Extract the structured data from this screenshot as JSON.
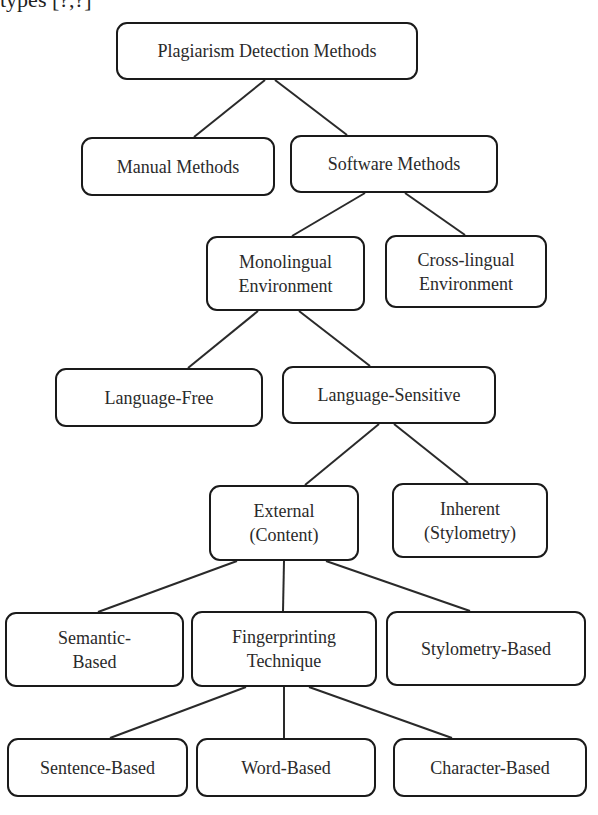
{
  "caption_fragment": "types [?,?]",
  "diagram": {
    "title": "Plagiarism Detection Methods",
    "line_color": "#2a2a2a",
    "node_border_color": "#1a1a1a",
    "nodes": {
      "root": {
        "lines": [
          "Plagiarism Detection Methods"
        ],
        "box": [
          116,
          22,
          302,
          58
        ]
      },
      "manual": {
        "lines": [
          "Manual Methods"
        ],
        "box": [
          81,
          137,
          194,
          59
        ]
      },
      "software": {
        "lines": [
          "Software Methods"
        ],
        "box": [
          290,
          135,
          208,
          58
        ]
      },
      "monolingual": {
        "lines": [
          "Monolingual",
          "Environment"
        ],
        "box": [
          206,
          236,
          159,
          75
        ]
      },
      "crosslingual": {
        "lines": [
          "Cross-lingual",
          "Environment"
        ],
        "box": [
          385,
          235,
          162,
          73
        ]
      },
      "language_free": {
        "lines": [
          "Language-Free"
        ],
        "box": [
          55,
          368,
          208,
          59
        ]
      },
      "language_sensitive": {
        "lines": [
          "Language-Sensitive"
        ],
        "box": [
          282,
          366,
          214,
          58
        ]
      },
      "external": {
        "lines": [
          "External",
          "(Content)"
        ],
        "box": [
          209,
          485,
          150,
          76
        ]
      },
      "inherent": {
        "lines": [
          "Inherent",
          "(Stylometry)"
        ],
        "box": [
          392,
          483,
          156,
          75
        ]
      },
      "semantic": {
        "lines": [
          "Semantic-",
          "Based"
        ],
        "box": [
          5,
          612,
          179,
          75
        ]
      },
      "fingerprinting": {
        "lines": [
          "Fingerprinting",
          "Technique"
        ],
        "box": [
          191,
          611,
          186,
          76
        ]
      },
      "stylometry_based": {
        "lines": [
          "Stylometry-Based"
        ],
        "box": [
          386,
          611,
          200,
          75
        ]
      },
      "sentence": {
        "lines": [
          "Sentence-Based"
        ],
        "box": [
          7,
          738,
          181,
          59
        ]
      },
      "word": {
        "lines": [
          "Word-Based"
        ],
        "box": [
          196,
          738,
          180,
          59
        ]
      },
      "character": {
        "lines": [
          "Character-Based"
        ],
        "box": [
          393,
          738,
          194,
          59
        ]
      }
    },
    "edges": [
      {
        "from": "root",
        "to": "manual",
        "pts": [
          265,
          80,
          194,
          137
        ]
      },
      {
        "from": "root",
        "to": "software",
        "pts": [
          275,
          80,
          347,
          135
        ]
      },
      {
        "from": "software",
        "to": "monolingual",
        "pts": [
          365,
          193,
          292,
          236
        ]
      },
      {
        "from": "software",
        "to": "crosslingual",
        "pts": [
          405,
          193,
          465,
          235
        ]
      },
      {
        "from": "monolingual",
        "to": "language_free",
        "pts": [
          258,
          311,
          188,
          368
        ]
      },
      {
        "from": "monolingual",
        "to": "language_sensitive",
        "pts": [
          299,
          311,
          370,
          366
        ]
      },
      {
        "from": "language_sensitive",
        "to": "external",
        "pts": [
          379,
          424,
          305,
          485
        ]
      },
      {
        "from": "language_sensitive",
        "to": "inherent",
        "pts": [
          394,
          424,
          468,
          483
        ]
      },
      {
        "from": "external",
        "to": "semantic",
        "pts": [
          237,
          561,
          98,
          612
        ]
      },
      {
        "from": "external",
        "to": "fingerprinting",
        "pts": [
          284,
          561,
          283,
          611
        ]
      },
      {
        "from": "external",
        "to": "stylometry_based",
        "pts": [
          326,
          561,
          470,
          611
        ]
      },
      {
        "from": "fingerprinting",
        "to": "sentence",
        "pts": [
          246,
          687,
          110,
          738
        ]
      },
      {
        "from": "fingerprinting",
        "to": "word",
        "pts": [
          284,
          687,
          284,
          738
        ]
      },
      {
        "from": "fingerprinting",
        "to": "character",
        "pts": [
          309,
          687,
          452,
          738
        ]
      }
    ]
  }
}
